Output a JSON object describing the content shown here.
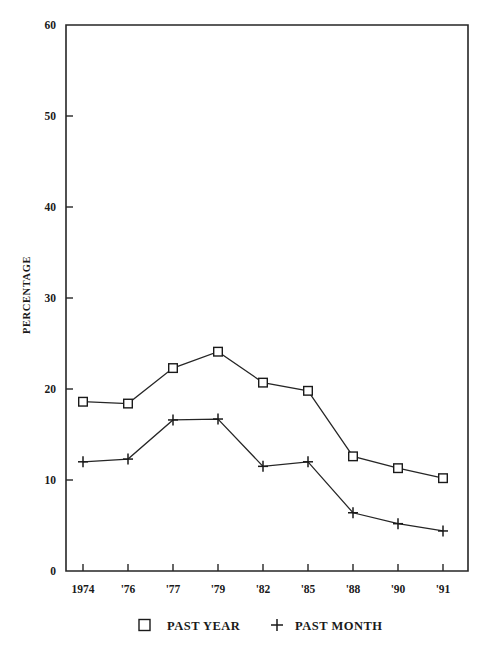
{
  "chart_data": {
    "type": "line",
    "title": "",
    "xlabel": "",
    "ylabel": "PERCENTAGE",
    "categories": [
      "1974",
      "'76",
      "'77",
      "'79",
      "'82",
      "'85",
      "'88",
      "'90",
      "'91"
    ],
    "ylim": [
      0,
      60
    ],
    "yticks": [
      0,
      10,
      20,
      30,
      40,
      50,
      60
    ],
    "ytick_labels": [
      "0",
      "10",
      "20",
      "30",
      "40",
      "50",
      "60"
    ],
    "grid": false,
    "legend_position": "bottom",
    "series": [
      {
        "name": "PAST YEAR",
        "marker": "square",
        "values": [
          18.6,
          18.4,
          22.3,
          24.1,
          20.7,
          19.8,
          12.6,
          11.3,
          10.2
        ]
      },
      {
        "name": "PAST MONTH",
        "marker": "plus",
        "values": [
          12.0,
          12.3,
          16.6,
          16.7,
          11.5,
          12.0,
          6.4,
          5.2,
          4.4
        ]
      }
    ]
  },
  "axes": {
    "y_axis_title": "PERCENTAGE",
    "y_tick_labels": [
      "60",
      "50",
      "40",
      "30",
      "20",
      "10",
      "0"
    ],
    "x_tick_labels": [
      "1974",
      "'76",
      "'77",
      "'79",
      "'82",
      "'85",
      "'88",
      "'90",
      "'91"
    ]
  },
  "legend": {
    "entries": [
      {
        "marker_icon": "square-marker-icon",
        "label": "PAST YEAR"
      },
      {
        "marker_icon": "plus-marker-icon",
        "label": "PAST MONTH"
      }
    ]
  },
  "colors": {
    "line": "#262626",
    "marker_fill": "#ffffff",
    "background": "#ffffff"
  }
}
